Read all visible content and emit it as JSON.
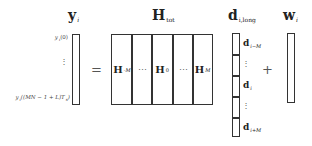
{
  "equation": {
    "lhs": {
      "symbol": "y",
      "subscript": "i",
      "entries": {
        "top": "y_i(0)",
        "top_display": "y",
        "top_sub": "i",
        "top_arg": "(0)",
        "middle": "⋮",
        "bottom_display": "y",
        "bottom_sub": "i",
        "bottom_arg": "((MN − 1 + L)T",
        "bottom_arg_sub": "s",
        "bottom_arg_end": ")"
      }
    },
    "equals": "=",
    "matrix": {
      "symbol": "H",
      "subscript": "tot",
      "blocks": [
        {
          "symbol": "H",
          "subscript": "-M"
        },
        {
          "symbol": "⋯",
          "subscript": ""
        },
        {
          "symbol": "H",
          "subscript": "0"
        },
        {
          "symbol": "⋯",
          "subscript": ""
        },
        {
          "symbol": "H",
          "subscript": "M"
        }
      ]
    },
    "data_vector": {
      "symbol": "d",
      "subscript": "i,long",
      "blocks": [
        {
          "symbol": "d",
          "subscript": "i−M"
        },
        {
          "symbol": "⋮",
          "subscript": ""
        },
        {
          "symbol": "d",
          "subscript": "i"
        },
        {
          "symbol": "⋮",
          "subscript": ""
        },
        {
          "symbol": "d",
          "subscript": "i+M"
        }
      ]
    },
    "plus": "+",
    "noise": {
      "symbol": "w",
      "subscript": "i"
    }
  },
  "colors": {
    "stroke": "#333333",
    "text": "#222222",
    "background": "#ffffff"
  }
}
